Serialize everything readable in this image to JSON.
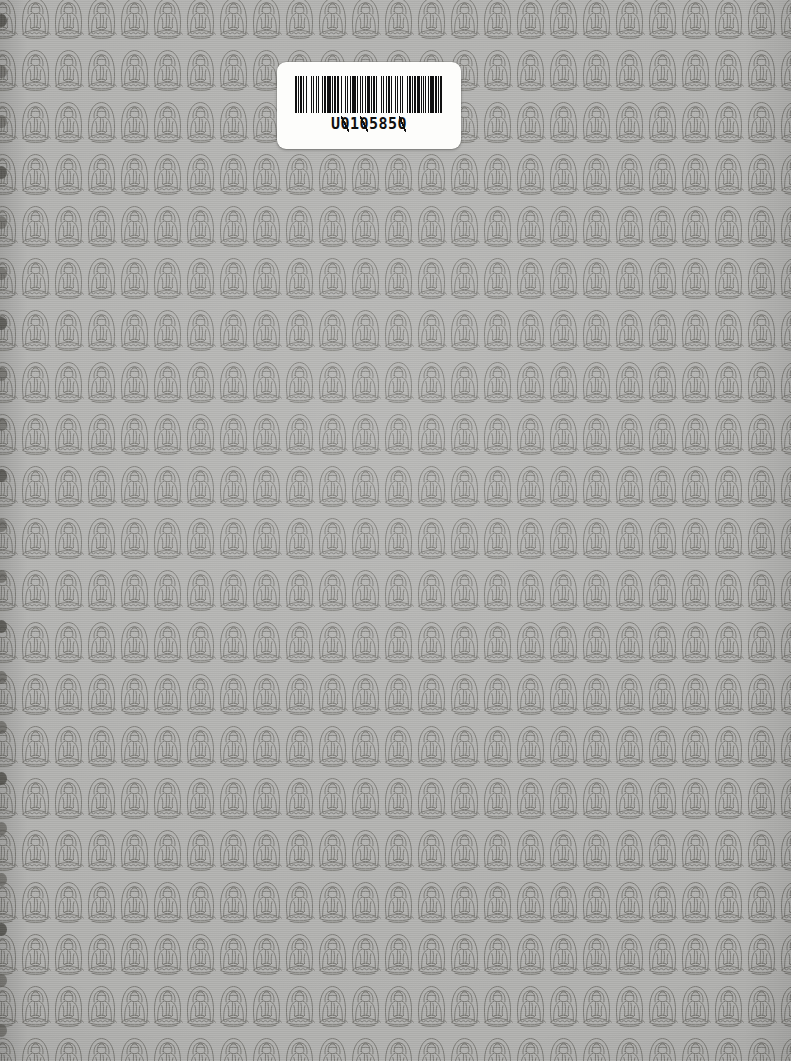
{
  "document": {
    "kind": "scanned-book-cover",
    "description": "Back cover of a book printed with a repeating seated Buddha line-art pattern",
    "background_color": "#b2b2b0",
    "ink_color": "#6b6a66"
  },
  "pattern": {
    "motif_name": "seated-buddha-on-lotus",
    "motif_parts": [
      "mandorla-halo",
      "head-with-topknot",
      "robed-torso",
      "hands-in-lap",
      "lotus-pedestal"
    ],
    "tile_width": 33,
    "tile_height": 52,
    "columns": 24,
    "rows": 21,
    "line_color": "#6b6a66",
    "fill_color": "#b2b2b0"
  },
  "barcode_label": {
    "name": "library-barcode-label",
    "number": "U0105850",
    "number_prefix": "U",
    "label_background": "#fdfdfb",
    "bar_color": "#101010",
    "bar_widths": [
      2,
      1,
      1,
      1,
      2,
      1,
      1,
      2,
      1,
      4,
      1,
      1,
      1,
      2,
      1,
      1,
      1,
      3,
      1,
      1,
      2,
      1,
      4,
      1,
      1,
      1,
      2,
      1,
      1,
      1,
      1,
      2,
      1,
      3,
      1,
      1,
      1,
      2,
      1,
      1,
      4,
      1,
      1,
      2,
      1,
      1,
      1,
      2,
      1,
      1,
      3,
      1,
      1,
      1,
      2,
      1,
      1,
      4,
      1,
      1,
      1,
      2,
      1,
      1,
      2,
      1,
      1,
      3,
      1,
      1,
      1,
      2,
      1,
      1,
      1,
      4,
      1,
      1,
      2,
      1,
      1,
      1,
      2,
      1,
      3,
      1,
      1,
      2,
      1,
      1,
      1,
      2,
      1,
      1,
      4,
      1,
      2,
      1,
      1,
      1,
      2
    ]
  },
  "gutter_marks": {
    "name": "binding-edge-marks",
    "count": 21,
    "color": "#55544f"
  }
}
